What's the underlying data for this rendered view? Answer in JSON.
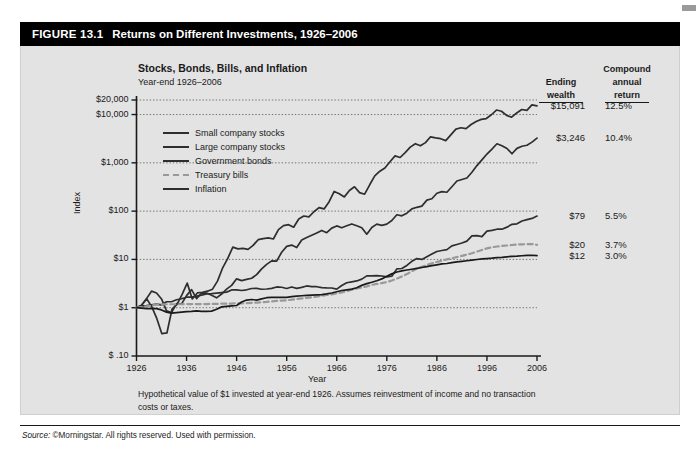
{
  "figure": {
    "number": "FIGURE 13.1",
    "title": "Returns on Different Investments, 1926–2006"
  },
  "chart_title": "Stocks, Bonds, Bills, and Inflation",
  "chart_subtitle": "Year-end 1926–2006",
  "footnote": "Hypothetical value of $1 invested at year-end 1926. Assumes reinvestment of income and no transaction costs or taxes.",
  "source": {
    "label": "Source:",
    "text": "©Morningstar. All rights reserved. Used with permission."
  },
  "table": {
    "head_ending": "Ending",
    "head_wealth": "wealth",
    "head_compound": "Compound",
    "head_annual": "annual",
    "head_return": "return"
  },
  "colors": {
    "header_bar": "#000000",
    "panel": "#e3e3e3",
    "line_dark": "#2e2e2e",
    "line_gray": "#999999",
    "axis": "#1a1a1a",
    "grid": "#555555"
  },
  "chart_data": {
    "type": "line",
    "title": "Stocks, Bonds, Bills, and Inflation",
    "subtitle": "Year-end 1926–2006",
    "xlabel": "Year",
    "ylabel": "Index",
    "yscale": "log",
    "ylim": [
      0.1,
      20000
    ],
    "xlim": [
      1926,
      2006
    ],
    "grid": true,
    "grid_axis": "y",
    "legend_position": "upper-left-inside",
    "ytick_labels": [
      "$20,000",
      "$10,000",
      "$1,000",
      "$100",
      "$10",
      "$1",
      "$ .10"
    ],
    "ytick_values": [
      20000,
      10000,
      1000,
      100,
      10,
      1,
      0.1
    ],
    "xtick_labels": [
      "1926",
      "1936",
      "1946",
      "1956",
      "1966",
      "1976",
      "1986",
      "1996",
      "2006"
    ],
    "xtick_values": [
      1926,
      1936,
      1946,
      1956,
      1966,
      1976,
      1986,
      1996,
      2006
    ],
    "series": [
      {
        "name": "Small company stocks",
        "style": "solid",
        "color": "#2e2e2e",
        "ending_wealth": "$15,091",
        "compound_annual_return": "12.5%",
        "values": [
          1,
          1.12,
          1.54,
          1.05,
          0.6,
          0.29,
          0.3,
          0.93,
          1.17,
          1.88,
          3.23,
          1.52,
          2.02,
          2.09,
          2.2,
          2.42,
          3.59,
          6.7,
          10.5,
          18.0,
          16.5,
          16.9,
          16.2,
          19.5,
          25.6,
          27.0,
          27.9,
          26.5,
          41.3,
          50.2,
          52.5,
          46.4,
          68.9,
          79.2,
          76.2,
          97.0,
          118.0,
          111.0,
          157.0,
          256.0,
          228.0,
          197.0,
          268.0,
          319.0,
          242.0,
          224.0,
          351.0,
          535.0,
          671.0,
          784.0,
          1050.0,
          1390.0,
          1290.0,
          1630.0,
          2110.0,
          2490.0,
          2250.0,
          2620.0,
          3460.0,
          3290.0,
          3160.0,
          2880.0,
          3790.0,
          5000.0,
          5320.0,
          5110.0,
          6210.0,
          7200.0,
          7930.0,
          8260.0,
          9900.0,
          12400.0,
          11700.0,
          9600.0,
          8800.0,
          10800.0,
          12700.0,
          12200.0,
          15900.0,
          15091.0
        ]
      },
      {
        "name": "Large company stocks",
        "style": "solid",
        "color": "#2e2e2e",
        "ending_wealth": "$3,246",
        "compound_annual_return": "10.4%",
        "values": [
          1,
          1.12,
          1.54,
          2.2,
          2.02,
          1.52,
          0.86,
          0.79,
          1.22,
          1.2,
          1.78,
          2.37,
          1.54,
          2.02,
          2.01,
          1.81,
          1.6,
          1.92,
          2.42,
          2.9,
          3.96,
          3.64,
          3.85,
          4.07,
          4.83,
          6.36,
          7.89,
          9.33,
          9.24,
          14.1,
          18.6,
          19.8,
          17.6,
          25.3,
          28.3,
          31.7,
          35.4,
          39.8,
          35.8,
          44.4,
          49.4,
          45.2,
          49.7,
          54.3,
          49.7,
          45.3,
          33.3,
          45.7,
          53.7,
          50.8,
          53.9,
          63.9,
          84.1,
          80.0,
          90.6,
          111.0,
          120.0,
          127.0,
          169.0,
          180.0,
          234.0,
          253.0,
          246.0,
          320.0,
          421.0,
          452.0,
          485.0,
          638.0,
          876.0,
          1150.0,
          1520.0,
          1930.0,
          2480.0,
          2250.0,
          1980.0,
          1540.0,
          1990.0,
          2200.0,
          2310.0,
          2680.0,
          3246.0
        ]
      },
      {
        "name": "Government bonds",
        "style": "solid",
        "color": "#2e2e2e",
        "ending_wealth": "$79",
        "compound_annual_return": "5.5%",
        "values": [
          1,
          1.09,
          1.1,
          1.14,
          1.19,
          1.14,
          1.33,
          1.33,
          1.46,
          1.53,
          1.65,
          1.65,
          1.74,
          1.82,
          1.93,
          1.95,
          2.01,
          2.05,
          2.1,
          2.33,
          2.33,
          2.27,
          2.35,
          2.5,
          2.51,
          2.41,
          2.44,
          2.52,
          2.69,
          2.65,
          2.5,
          2.69,
          2.52,
          2.63,
          2.82,
          2.74,
          2.72,
          2.6,
          2.57,
          2.56,
          2.43,
          2.88,
          3.29,
          3.43,
          3.58,
          3.91,
          4.56,
          4.57,
          4.6,
          4.54,
          4.36,
          4.5,
          6.37,
          6.49,
          7.5,
          9.13,
          10.4,
          10.0,
          11.4,
          12.9,
          14.6,
          15.3,
          16.0,
          19.1,
          20.4,
          21.9,
          23.9,
          30.8,
          31.2,
          29.6,
          38.6,
          40.0,
          42.2,
          42.2,
          46.6,
          53.2,
          54.5,
          62.6,
          66.5,
          70.5,
          79.0
        ]
      },
      {
        "name": "Treasury bills",
        "style": "dashed",
        "color": "#999999",
        "ending_wealth": "$20",
        "compound_annual_return": "3.7%",
        "values": [
          1,
          1.03,
          1.07,
          1.11,
          1.16,
          1.17,
          1.18,
          1.18,
          1.18,
          1.18,
          1.19,
          1.19,
          1.19,
          1.19,
          1.19,
          1.2,
          1.2,
          1.21,
          1.21,
          1.22,
          1.23,
          1.23,
          1.24,
          1.26,
          1.28,
          1.3,
          1.32,
          1.35,
          1.39,
          1.4,
          1.42,
          1.47,
          1.52,
          1.56,
          1.6,
          1.64,
          1.69,
          1.76,
          1.83,
          1.89,
          1.98,
          2.08,
          2.2,
          2.35,
          2.5,
          2.61,
          2.77,
          2.97,
          3.11,
          3.23,
          3.4,
          3.65,
          4.0,
          4.44,
          4.96,
          5.68,
          6.47,
          7.03,
          7.64,
          8.28,
          8.86,
          9.43,
          9.99,
          10.58,
          11.22,
          11.85,
          12.56,
          13.44,
          14.53,
          15.68,
          16.91,
          17.83,
          18.5,
          18.97,
          19.4,
          19.86,
          20.35,
          20.5,
          20.7,
          20.8,
          20.0
        ]
      },
      {
        "name": "Inflation",
        "style": "solid",
        "color": "#1a1a1a",
        "ending_wealth": "$12",
        "compound_annual_return": "3.0%",
        "values": [
          1,
          0.98,
          0.96,
          0.96,
          0.96,
          0.9,
          0.81,
          0.77,
          0.79,
          0.81,
          0.83,
          0.84,
          0.86,
          0.84,
          0.84,
          0.85,
          0.93,
          1.04,
          1.07,
          1.09,
          1.11,
          1.31,
          1.44,
          1.48,
          1.44,
          1.52,
          1.61,
          1.63,
          1.64,
          1.63,
          1.64,
          1.69,
          1.74,
          1.77,
          1.8,
          1.82,
          1.84,
          1.87,
          1.93,
          2.02,
          2.14,
          2.27,
          2.34,
          2.42,
          2.59,
          2.9,
          3.15,
          3.36,
          3.62,
          3.95,
          4.48,
          5.02,
          5.48,
          5.81,
          6.03,
          6.26,
          6.5,
          6.79,
          7.09,
          7.41,
          7.74,
          8.08,
          8.24,
          8.61,
          8.89,
          9.14,
          9.38,
          9.65,
          9.96,
          10.26,
          10.43,
          10.6,
          10.89,
          11.07,
          11.33,
          11.58,
          11.7,
          11.9,
          12.1,
          12.2,
          12.0
        ]
      }
    ]
  }
}
